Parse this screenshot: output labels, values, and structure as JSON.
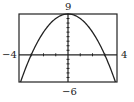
{
  "chart_data": {
    "type": "line",
    "title": "",
    "xlabel": "",
    "ylabel": "",
    "function": "y = 9 - x^2",
    "xlim": [
      -4,
      4
    ],
    "ylim": [
      -6,
      9
    ],
    "x_tick_step": 1,
    "y_tick_step": 1,
    "grid": false,
    "labels": {
      "xmin": "−4",
      "xmax": "4",
      "ymin": "−6",
      "ymax": "9"
    },
    "series": [
      {
        "name": "parabola",
        "x": [
          -3.873,
          -3,
          -2,
          -1,
          0,
          1,
          2,
          3,
          3.873
        ],
        "values": [
          -6,
          0,
          5,
          8,
          9,
          8,
          5,
          0,
          -6
        ]
      }
    ]
  }
}
